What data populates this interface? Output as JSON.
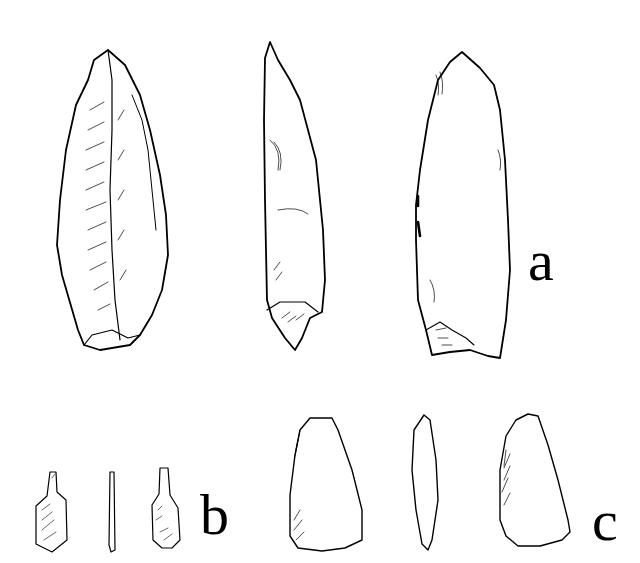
{
  "figure": {
    "groups": [
      {
        "label": "a",
        "views": 3,
        "subject": "large pointed flake/blade tool, three views"
      },
      {
        "label": "b",
        "views": 3,
        "subject": "small tanged point, three views"
      },
      {
        "label": "c",
        "views": 3,
        "subject": "trapezoidal polished tool, three views"
      }
    ]
  },
  "colors": {
    "ink": "#000000",
    "background": "#ffffff"
  }
}
